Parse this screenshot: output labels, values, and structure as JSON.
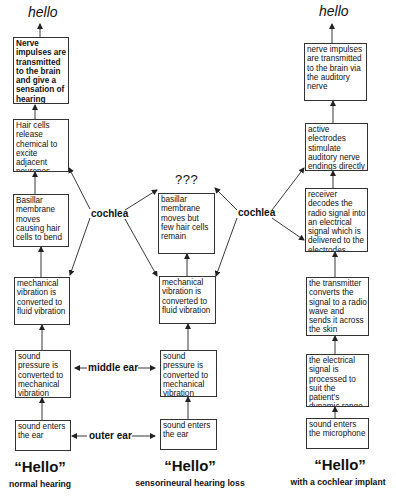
{
  "columns": {
    "normal": {
      "top_output": "hello",
      "boxes": [
        "Nerve impulses are transmitted to the brain and give a sensation of hearing",
        "Hair cells release chemical to excite adjacent neurones",
        "Basillar membrane moves causing hair cells to bend",
        "mechanical vibration is converted to fluid vibration",
        "sound pressure is converted to mechanical vibration",
        "sound enters the ear"
      ],
      "title": "“Hello”",
      "caption": "normal hearing"
    },
    "loss": {
      "top_output": "???",
      "boxes": [
        "basillar membrane moves but few hair cells remain",
        "mechanical vibration is converted to fluid vibration",
        "sound pressure is converted to mechanical vibration",
        "sound enters the ear"
      ],
      "title": "“Hello”",
      "caption": "sensorineural hearing loss"
    },
    "implant": {
      "top_output": "hello",
      "boxes": [
        "nerve impulses are transmitted to the brain via the auditory nerve",
        "active electrodes stimulate auditory nerve endings directly",
        "receiver decodes the radio signal into an electrical signal which is delivered to the electrodes",
        "the transmitter converts the signal to a radio wave and sends it across the skin",
        "the electrical signal is processed to suit the patient's dynamic range",
        "sound enters the microphone"
      ],
      "title": "“Hello”",
      "caption": "with a cochlear implant"
    }
  },
  "region_labels": {
    "cochlea_left": "cochlea",
    "cochlea_right": "cochlea",
    "middle_ear": "middle ear",
    "outer_ear": "outer ear"
  }
}
